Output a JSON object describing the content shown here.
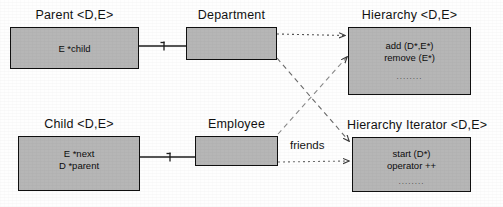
{
  "diagram": {
    "type": "uml-class-diagram",
    "classes": [
      {
        "id": "parent",
        "title": "Parent <D,E>",
        "members": [
          "E *child"
        ],
        "ellipsis": "",
        "x": 10,
        "y": 27,
        "w": 129,
        "h": 42
      },
      {
        "id": "department",
        "title": "Department",
        "members": [],
        "ellipsis": "",
        "x": 186,
        "y": 27,
        "w": 91,
        "h": 33
      },
      {
        "id": "hierarchy",
        "title": "Hierarchy <D,E>",
        "members": [
          "add (D*,E*)",
          "remove (E*)"
        ],
        "ellipsis": "........",
        "x": 348,
        "y": 27,
        "w": 123,
        "h": 68
      },
      {
        "id": "child",
        "title": "Child <D,E>",
        "members": [
          "E *next",
          "D *parent"
        ],
        "ellipsis": "",
        "x": 18,
        "y": 136,
        "w": 122,
        "h": 55
      },
      {
        "id": "employee",
        "title": "Employee",
        "members": [],
        "ellipsis": "",
        "x": 195,
        "y": 136,
        "w": 83,
        "h": 30
      },
      {
        "id": "hierarchy-iterator",
        "title": "Hierarchy Iterator <D,E>",
        "members": [
          "start (D*)",
          "operator ++"
        ],
        "ellipsis": "........",
        "x": 352,
        "y": 137,
        "w": 119,
        "h": 55
      }
    ],
    "edge_labels": [
      {
        "id": "friends",
        "text": "friends",
        "x": 290,
        "y": 139
      }
    ],
    "colors": {
      "box_fill": "#b6b6b6",
      "box_border": "#101010",
      "text": "#121212",
      "wire": "#2a2a2a",
      "wire_dotted": "#555555",
      "page": "#fefefe"
    }
  }
}
